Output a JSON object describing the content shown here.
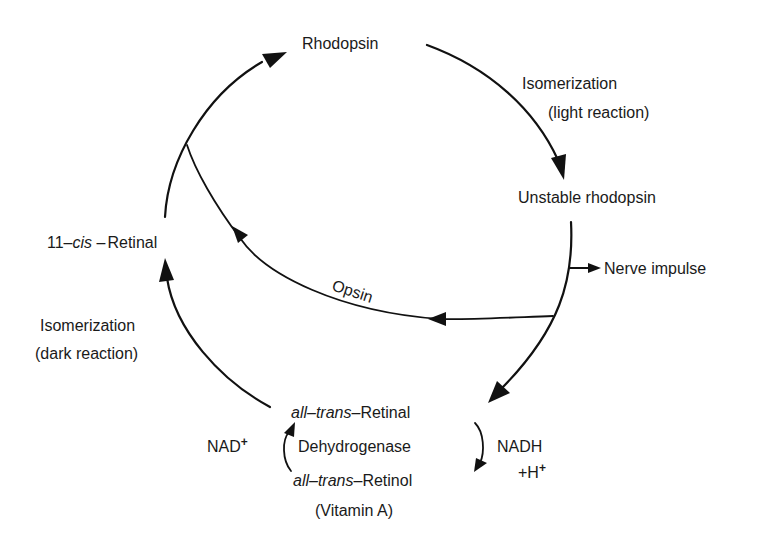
{
  "diagram": {
    "type": "cycle",
    "nodes": {
      "rhodopsin": "Rhodopsin",
      "unstable_rhodopsin": "Unstable rhodopsin",
      "cis_retinal": {
        "prefix": "11–",
        "italic": "cis",
        "dash": " –",
        "suffix": "Retinal"
      },
      "trans_retinal": {
        "italic": "all–trans",
        "dash": "–",
        "suffix": "Retinal"
      },
      "trans_retinol": {
        "italic": "all–trans",
        "dash": "–",
        "suffix": "Retinol"
      },
      "vitamin_a": "(Vitamin A)",
      "nerve_impulse": "Nerve impulse"
    },
    "edge_labels": {
      "light_isomerization_line1": "Isomerization",
      "light_isomerization_line2": "(light reaction)",
      "dark_isomerization_line1": "Isomerization",
      "dark_isomerization_line2": "(dark reaction)",
      "opsin": "Opsin",
      "dehydrogenase": "Dehydrogenase"
    },
    "cofactors": {
      "nad_plus": {
        "base": "NAD",
        "sup": "+"
      },
      "nadh": {
        "line1": "NADH",
        "line2_base": "+H",
        "line2_sup": "+"
      }
    },
    "edges": [
      {
        "from": "Rhodopsin",
        "to": "Unstable rhodopsin",
        "label": "Isomerization (light reaction)"
      },
      {
        "from": "Unstable rhodopsin",
        "to": "Nerve impulse"
      },
      {
        "from": "Unstable rhodopsin",
        "to": "11-cis-Retinal",
        "label": "Opsin"
      },
      {
        "from": "Unstable rhodopsin",
        "to": "all-trans-Retinal"
      },
      {
        "from": "all-trans-Retinal",
        "to": "all-trans-Retinol",
        "label": "Dehydrogenase",
        "cofactor": "NADH + H+"
      },
      {
        "from": "all-trans-Retinol",
        "to": "all-trans-Retinal",
        "label": "Dehydrogenase",
        "cofactor": "NAD+"
      },
      {
        "from": "all-trans-Retinal",
        "to": "11-cis-Retinal",
        "label": "Isomerization (dark reaction)"
      },
      {
        "from": "11-cis-Retinal",
        "to": "Rhodopsin"
      }
    ]
  }
}
